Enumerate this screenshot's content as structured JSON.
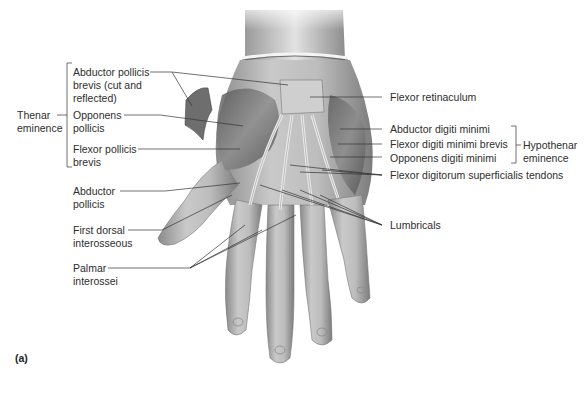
{
  "figure": {
    "panel_label": "(a)",
    "left_labels": {
      "group": {
        "line1": "Thenar",
        "line2": "eminence"
      },
      "abductor_pollicis_brevis": {
        "line1": "Abductor pollicis",
        "line2": "brevis (cut and",
        "line3": "reflected)"
      },
      "opponens_pollicis": {
        "line1": "Opponens",
        "line2": "pollicis"
      },
      "flexor_pollicis_brevis": {
        "line1": "Flexor pollicis",
        "line2": "brevis"
      },
      "abductor_pollicis": {
        "line1": "Abductor",
        "line2": "pollicis"
      },
      "first_dorsal_interosseous": {
        "line1": "First dorsal",
        "line2": "interosseous"
      },
      "palmar_interossei": {
        "line1": "Palmar",
        "line2": "interossei"
      }
    },
    "right_labels": {
      "flexor_retinaculum": "Flexor retinaculum",
      "abductor_digiti_minimi": "Abductor digiti minimi",
      "flexor_digiti_minimi_brevis": "Flexor digiti minimi brevis",
      "opponens_digiti_minimi": "Opponens digiti minimi",
      "group": {
        "line1": "Hypothenar",
        "line2": "eminence"
      },
      "flexor_digitorum_superficialis_tendons": "Flexor digitorum superficialis tendons",
      "lumbricals": "Lumbricals"
    }
  }
}
